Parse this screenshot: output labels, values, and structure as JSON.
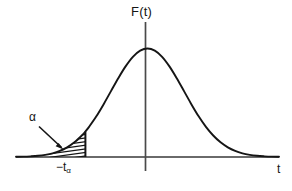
{
  "figure": {
    "title": "",
    "background_color": "#ffffff",
    "stroke_color": "#151515",
    "axis_color": "#555555",
    "labels": {
      "y_axis": "F(t)",
      "x_axis": "t",
      "shaded_area": "α",
      "critical_value_prefix": "−t",
      "critical_value_subscript": "α"
    }
  },
  "chart_data": {
    "type": "line",
    "title": "",
    "subtitle": "",
    "xlabel": "t",
    "ylabel": "F(t)",
    "grid": false,
    "legend": null,
    "xlim": [
      -3.6,
      3.6
    ],
    "ylim": [
      0,
      1.05
    ],
    "x_axis_ticks": [
      "−tα"
    ],
    "x_tick_values": [
      -1.7
    ],
    "annotations": [
      {
        "text": "α",
        "points_to": "shaded-tail-region",
        "x": -2.45,
        "y": 0.33
      },
      {
        "text": "F(t)",
        "x": 0.0,
        "y": 1.0
      },
      {
        "text": "t",
        "x": 3.55,
        "y": 0.0
      }
    ],
    "shaded_region": {
      "label": "α",
      "from": -3.6,
      "to": -1.7,
      "fill": "hatched"
    },
    "series": [
      {
        "name": "F(t)",
        "x": [
          -3.6,
          -3.4,
          -3.2,
          -3.0,
          -2.8,
          -2.6,
          -2.4,
          -2.2,
          -2.0,
          -1.8,
          -1.7,
          -1.6,
          -1.4,
          -1.2,
          -1.0,
          -0.8,
          -0.6,
          -0.4,
          -0.2,
          0.0,
          0.2,
          0.4,
          0.6,
          0.8,
          1.0,
          1.2,
          1.4,
          1.6,
          1.8,
          2.0,
          2.2,
          2.4,
          2.6,
          2.8,
          3.0,
          3.2,
          3.4,
          3.6
        ],
        "y": [
          0.002,
          0.003,
          0.006,
          0.011,
          0.02,
          0.034,
          0.056,
          0.089,
          0.135,
          0.198,
          0.235,
          0.278,
          0.375,
          0.487,
          0.607,
          0.726,
          0.835,
          0.923,
          0.98,
          1.0,
          0.98,
          0.923,
          0.835,
          0.726,
          0.607,
          0.487,
          0.375,
          0.278,
          0.198,
          0.135,
          0.089,
          0.056,
          0.034,
          0.02,
          0.011,
          0.006,
          0.003,
          0.002
        ]
      }
    ]
  }
}
